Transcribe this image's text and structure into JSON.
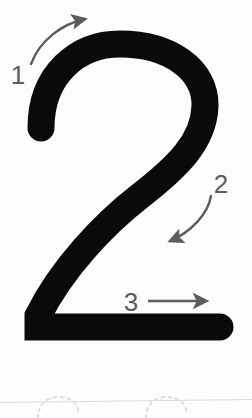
{
  "worksheet": {
    "title": "Number 2 stroke order guide",
    "glyph": "2",
    "glyph_color": "#0a0a0a",
    "background_color": "#fdfdfd",
    "arrow_color": "#5c5c5c",
    "guide_line_color": "#d8dadd",
    "dotted_trace_color": "#dcdee1",
    "width": 252,
    "height": 418
  },
  "strokes": [
    {
      "number": "1",
      "label_x": 18,
      "label_y": 84,
      "direction": "up-right",
      "arrow_type": "curved",
      "icon": "curved-arrow-up-right-icon"
    },
    {
      "number": "2",
      "label_x": 212,
      "label_y": 193,
      "direction": "down-left",
      "arrow_type": "curved",
      "icon": "curved-arrow-down-left-icon"
    },
    {
      "number": "3",
      "label_x": 122,
      "label_y": 311,
      "direction": "right",
      "arrow_type": "straight",
      "icon": "straight-arrow-right-icon"
    }
  ],
  "baseline": {
    "name": "ruled-guide-line",
    "y_left": 402,
    "y_right": 399
  },
  "trace_shapes": [
    {
      "name": "dotted-practice-digit-1",
      "cx": 56,
      "cy": 417
    },
    {
      "name": "dotted-practice-digit-2",
      "cx": 164,
      "cy": 417
    }
  ]
}
